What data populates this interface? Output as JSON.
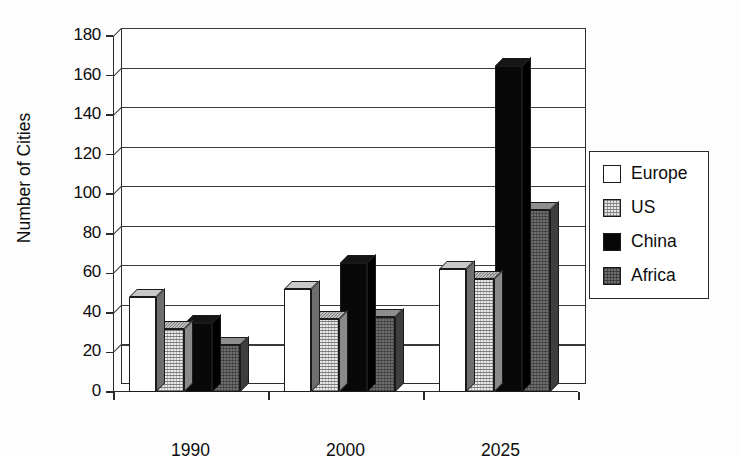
{
  "chart_data": {
    "type": "bar",
    "title": "",
    "subtitle": "",
    "xlabel": "",
    "ylabel": "Number of Cities",
    "categories": [
      "1990",
      "2000",
      "2025"
    ],
    "series": [
      {
        "name": "Europe",
        "values": [
          48,
          52,
          62
        ],
        "color": "#ffffff",
        "pattern": "solid-white"
      },
      {
        "name": "US",
        "values": [
          32,
          37,
          57
        ],
        "color": "#e4e4e4",
        "pattern": "light-stipple"
      },
      {
        "name": "China",
        "values": [
          35,
          65,
          165
        ],
        "color": "#070707",
        "pattern": "solid-black"
      },
      {
        "name": "Africa",
        "values": [
          24,
          38,
          92
        ],
        "color": "#6d6d6d",
        "pattern": "dark-stipple"
      }
    ],
    "ylim": [
      0,
      180
    ],
    "yticks": [
      0,
      20,
      40,
      60,
      80,
      100,
      120,
      140,
      160,
      180
    ],
    "ytick_labels": [
      "0",
      "20",
      "40",
      "60",
      "80",
      "100",
      "120",
      "140",
      "160",
      "180"
    ],
    "grid": true,
    "grid_axis": "y",
    "legend_position": "right",
    "style": "3d-column",
    "annotations": []
  },
  "legend": {
    "items": [
      {
        "label": "Europe",
        "swatch_class": "sw-europe"
      },
      {
        "label": "US",
        "swatch_class": "sw-us"
      },
      {
        "label": "China",
        "swatch_class": "sw-china"
      },
      {
        "label": "Africa",
        "swatch_class": "sw-africa"
      }
    ]
  }
}
